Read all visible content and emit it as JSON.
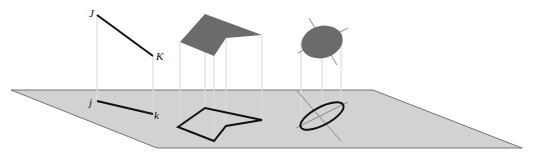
{
  "diagram": {
    "colors": {
      "plane_fill": "#d2d2d2",
      "plane_edge": "#555555",
      "solid_fill": "#6b6b6b",
      "projector": "#dcdcdc",
      "outline": "#111111",
      "axis_line": "#8a8a8a"
    },
    "labels": {
      "J": "J",
      "K": "K",
      "j": "j",
      "k": "k"
    },
    "objects": [
      {
        "name": "segment",
        "upper": "J–K",
        "projection": "j–k"
      },
      {
        "name": "polygon",
        "upper": "filled quadrilateral-pentagon",
        "projection": "outlined pentagon"
      },
      {
        "name": "ellipse",
        "upper": "filled disk with axes",
        "projection": "outlined ellipse with axes"
      }
    ]
  }
}
